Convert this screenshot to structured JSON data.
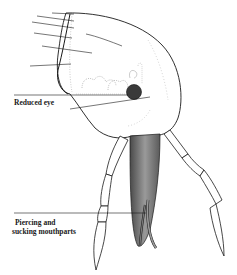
{
  "figure": {
    "colors": {
      "ink": "#1a1a1a",
      "eye_fill": "#3a3a3a",
      "mouthpart_fill": "#8c8c8c",
      "mouthpart_shade": "#5a5a5a",
      "background": "#ffffff"
    }
  },
  "labels": [
    {
      "id": "reduced_eye",
      "text": "Reduced eye"
    },
    {
      "id": "mouthparts_line1",
      "text": "Piercing and"
    },
    {
      "id": "mouthparts_line2",
      "text": "sucking mouthparts"
    }
  ],
  "unlabeled_leader_lines": 6
}
